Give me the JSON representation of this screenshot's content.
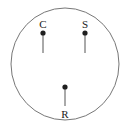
{
  "figure": {
    "title": "",
    "background_color": "#ffffff",
    "boundary": {
      "shape": "circle",
      "center_x": 65,
      "center_y": 64,
      "radius_x": 54,
      "radius_y": 56,
      "stroke_color": "#777777",
      "stroke_width": 1
    },
    "marker_style": {
      "dot_color": "#1f1f1f",
      "dot_radius": 2.6,
      "stem_color": "#555555",
      "stem_width": 1,
      "label_color": "#1a1a1a",
      "label_font_size": 11
    },
    "markers": [
      {
        "id": "marker-c",
        "label": "C",
        "label_x": 43,
        "label_y": 28,
        "label_position": "above",
        "dot_x": 43,
        "dot_y": 33,
        "stem_from_y": 33,
        "stem_to_y": 53
      },
      {
        "id": "marker-s",
        "label": "S",
        "label_x": 85,
        "label_y": 28,
        "label_position": "above",
        "dot_x": 85,
        "dot_y": 33,
        "stem_from_y": 33,
        "stem_to_y": 53
      },
      {
        "id": "marker-r",
        "label": "R",
        "label_x": 65,
        "label_y": 118,
        "label_position": "below",
        "dot_x": 65,
        "dot_y": 87,
        "stem_from_y": 87,
        "stem_to_y": 106
      }
    ]
  }
}
